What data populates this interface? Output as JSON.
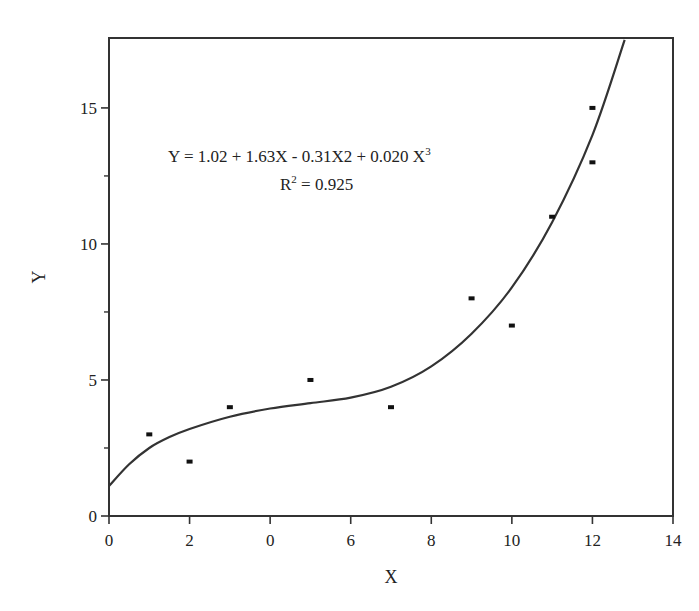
{
  "chart_data": {
    "type": "scatter",
    "title": "",
    "xlabel": "X",
    "ylabel": "Y",
    "xlim": [
      0,
      14
    ],
    "ylim": [
      0,
      17.5
    ],
    "grid": false,
    "x_tick_labels": [
      "0",
      "2",
      "0",
      "6",
      "8",
      "10",
      "12",
      "14"
    ],
    "x_tick_values": [
      0,
      2,
      4,
      6,
      8,
      10,
      12,
      14
    ],
    "y_tick_labels": [
      "0",
      "5",
      "10",
      "15"
    ],
    "y_tick_values": [
      0,
      5,
      10,
      15
    ],
    "y_minor_ticks": [
      2.5,
      7.5,
      12.5
    ],
    "series": [
      {
        "name": "data",
        "type": "scatter",
        "points": [
          {
            "x": 1,
            "y": 3
          },
          {
            "x": 2,
            "y": 2
          },
          {
            "x": 3,
            "y": 4
          },
          {
            "x": 5,
            "y": 5
          },
          {
            "x": 7,
            "y": 4
          },
          {
            "x": 9,
            "y": 8
          },
          {
            "x": 10,
            "y": 7
          },
          {
            "x": 11,
            "y": 11
          },
          {
            "x": 12,
            "y": 15
          },
          {
            "x": 12,
            "y": 13
          }
        ]
      },
      {
        "name": "cubic fit",
        "type": "line",
        "points": [
          {
            "x": 0,
            "y": 1.1
          },
          {
            "x": 0.5,
            "y": 1.9
          },
          {
            "x": 1,
            "y": 2.5
          },
          {
            "x": 1.5,
            "y": 2.9
          },
          {
            "x": 2,
            "y": 3.2
          },
          {
            "x": 3,
            "y": 3.65
          },
          {
            "x": 4,
            "y": 3.95
          },
          {
            "x": 5,
            "y": 4.15
          },
          {
            "x": 6,
            "y": 4.35
          },
          {
            "x": 7,
            "y": 4.75
          },
          {
            "x": 8,
            "y": 5.5
          },
          {
            "x": 9,
            "y": 6.7
          },
          {
            "x": 10,
            "y": 8.4
          },
          {
            "x": 11,
            "y": 10.8
          },
          {
            "x": 12,
            "y": 14.0
          },
          {
            "x": 12.8,
            "y": 17.5
          }
        ]
      }
    ],
    "annotations": {
      "equation": "Y = 1.02 + 1.63X - 0.31X2 + 0.020 X",
      "equation_sup": "3",
      "r2_prefix": "R",
      "r2_sup": "2",
      "r2_value": " = 0.925"
    }
  }
}
